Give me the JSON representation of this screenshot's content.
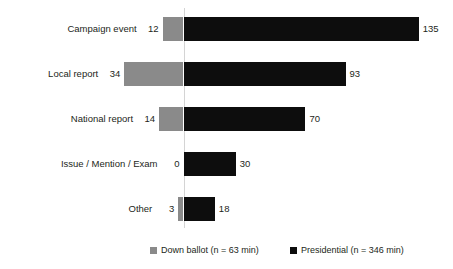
{
  "chart_data": {
    "type": "bar",
    "orientation": "horizontal",
    "subtype": "diverging-bidirectional",
    "title": "",
    "subtitle": "",
    "xlabel": "",
    "ylabel": "",
    "grid": false,
    "legend_position": "bottom",
    "axis_zero_line": true,
    "categories": [
      "Campaign event",
      "Local report",
      "National report",
      "Issue / Mention / Exam",
      "Other"
    ],
    "series": [
      {
        "name": "Down ballot (n = 63 min)",
        "short_name": "Down ballot",
        "n_label": "n = 63 min",
        "color": "#8a8a8a",
        "direction": "left",
        "values": [
          12,
          34,
          14,
          0,
          3
        ],
        "labels": [
          "12",
          "34",
          "14",
          "0",
          "3"
        ]
      },
      {
        "name": "Presidential (n = 346 min)",
        "short_name": "Presidential",
        "n_label": "n = 346 min",
        "color": "#0d0d0d",
        "direction": "right",
        "values": [
          135,
          93,
          70,
          30,
          18
        ],
        "labels": [
          "135",
          "93",
          "70",
          "30",
          "18"
        ]
      }
    ],
    "xlim": [
      -40,
      140
    ],
    "units": "minutes"
  },
  "legend": {
    "items": [
      {
        "label": "Down ballot (n = 63 min)",
        "color": "#8a8a8a"
      },
      {
        "label": "Presidential (n = 346 min)",
        "color": "#0d0d0d"
      }
    ]
  },
  "colors": {
    "down_ballot": "#8a8a8a",
    "presidential": "#0d0d0d",
    "axis_line": "#d4d4d4",
    "text": "#231f20",
    "background": "#ffffff"
  }
}
